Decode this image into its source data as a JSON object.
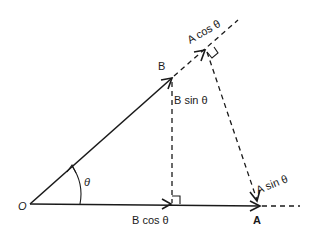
{
  "diagram": {
    "type": "vector-projection",
    "points": {
      "origin": "O",
      "vector_a_tip": "A",
      "vector_b_tip": "B"
    },
    "angle_label": "θ",
    "labels": {
      "a_cos": "A cos θ",
      "a_sin": "A sin θ",
      "b_sin": "B sin θ",
      "b_cos": "B cos θ"
    },
    "colors": {
      "ink": "#1a1a1a",
      "background": "#ffffff"
    }
  }
}
